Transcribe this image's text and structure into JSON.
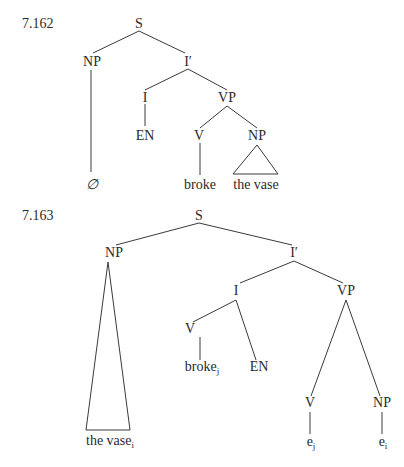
{
  "examples": [
    {
      "number": "7.162",
      "nodes": {
        "S": "S",
        "NP": "NP",
        "Ibar": "I′",
        "I": "I",
        "VP": "VP",
        "EN": "EN",
        "V": "V",
        "NP_obj": "NP",
        "empty": "∅",
        "verb": "broke",
        "object": "the vase"
      }
    },
    {
      "number": "7.163",
      "nodes": {
        "S": "S",
        "NP": "NP",
        "Ibar": "I′",
        "I": "I",
        "VP": "VP",
        "V_in_I": "V",
        "verb": "broke",
        "verb_index": "j",
        "EN": "EN",
        "V_trace_node": "V",
        "NP_trace_node": "NP",
        "trace_v": "e",
        "trace_v_index": "j",
        "trace_np": "e",
        "trace_np_index": "i",
        "subject": "the vase",
        "subject_index": "i"
      }
    }
  ],
  "colors": {
    "ink": "#2a2a2a",
    "background": "#ffffff"
  }
}
